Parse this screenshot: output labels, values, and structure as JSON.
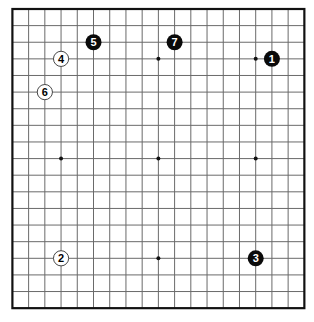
{
  "board": {
    "size": 19,
    "origin_x": 12.4,
    "origin_y": 9,
    "spacing_x": 16.22,
    "spacing_y": 16.62,
    "line_color": "#6a6a6a",
    "border_color": "#111111",
    "background": "#ffffff",
    "star_points": [
      [
        3,
        3
      ],
      [
        9,
        3
      ],
      [
        15,
        3
      ],
      [
        3,
        9
      ],
      [
        9,
        9
      ],
      [
        15,
        9
      ],
      [
        3,
        15
      ],
      [
        9,
        15
      ],
      [
        15,
        15
      ]
    ]
  },
  "stones": [
    {
      "number": "1",
      "color": "black",
      "col": 16,
      "row": 3
    },
    {
      "number": "2",
      "color": "white",
      "col": 3,
      "row": 15
    },
    {
      "number": "3",
      "color": "black",
      "col": 15,
      "row": 15
    },
    {
      "number": "4",
      "color": "white",
      "col": 3,
      "row": 3
    },
    {
      "number": "5",
      "color": "black",
      "col": 5,
      "row": 2
    },
    {
      "number": "6",
      "color": "white",
      "col": 2,
      "row": 5
    },
    {
      "number": "7",
      "color": "black",
      "col": 10,
      "row": 2
    }
  ]
}
